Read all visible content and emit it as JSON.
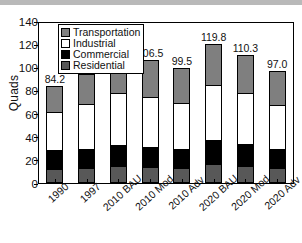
{
  "chart_data": {
    "type": "bar",
    "subtype": "stacked-bar",
    "title": "",
    "xlabel": "",
    "ylabel": "Quads",
    "ylim": [
      0,
      140
    ],
    "ytick_step": 20,
    "yticks": [
      0,
      20,
      40,
      60,
      80,
      100,
      120,
      140
    ],
    "grid": false,
    "legend_position": "top-left-inside",
    "categories": [
      "1990",
      "1997",
      "2010 BAU",
      "2010 Mod",
      "2010 Adv",
      "2020 BAU",
      "2020 Mod",
      "2020 Adv"
    ],
    "series": [
      {
        "name": "Residential",
        "color": "#585858",
        "values": [
          11.0,
          11.8,
          13.2,
          12.6,
          11.6,
          14.6,
          13.2,
          11.4
        ]
      },
      {
        "name": "Commercial",
        "color": "#000000",
        "values": [
          16.0,
          16.4,
          18.6,
          17.6,
          16.4,
          21.0,
          19.0,
          16.6
        ]
      },
      {
        "name": "Industrial",
        "color": "#ffffff",
        "values": [
          34.8,
          40.4,
          46.2,
          44.4,
          41.6,
          49.8,
          45.6,
          40.2
        ]
      },
      {
        "name": "Transportation",
        "color": "#7f7f7f",
        "values": [
          22.4,
          25.4,
          32.5,
          31.9,
          29.9,
          34.4,
          32.5,
          28.8
        ]
      }
    ],
    "totals": [
      84.2,
      94.0,
      110.5,
      106.5,
      99.5,
      119.8,
      110.3,
      97.0
    ],
    "total_labels": [
      "84.2",
      "94.0",
      "110.5",
      "106.5",
      "99.5",
      "119.8",
      "110.3",
      "97.0"
    ]
  },
  "legend": {
    "entries": [
      {
        "label": "Transportation",
        "swatch": "sw-transportation"
      },
      {
        "label": "Industrial",
        "swatch": "sw-industrial"
      },
      {
        "label": "Commercial",
        "swatch": "sw-commercial"
      },
      {
        "label": "Residential",
        "swatch": "sw-residential"
      }
    ]
  }
}
